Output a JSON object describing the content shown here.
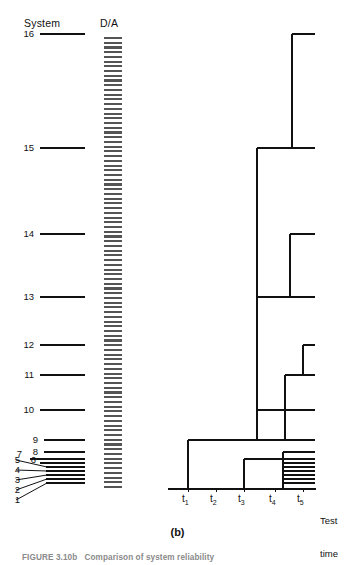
{
  "figure": {
    "panel_letter": "(b)",
    "caption": "FIGURE 3.10b   Comparison of system reliability",
    "axis_headers": {
      "system": "System",
      "da": "D/A"
    },
    "time_axis_label_line1": "Test",
    "time_axis_label_line2": "time"
  },
  "system_axis": {
    "labels": [
      "16",
      "15",
      "14",
      "13",
      "12",
      "11",
      "10",
      "9",
      "8",
      "7",
      "6",
      "5",
      "4",
      "3",
      "2",
      "1"
    ]
  },
  "time_axis": {
    "ticks": [
      "t",
      "t",
      "t",
      "t",
      "t"
    ],
    "tick_subscripts": [
      "1",
      "2",
      "3",
      "4",
      "5"
    ]
  },
  "chart_data": {
    "type": "dendrogram",
    "title": "Comparison of system reliability",
    "xlabel": "Test time",
    "ylabel": "System",
    "grid": false,
    "legend": null,
    "x_categories": [
      "t1",
      "t2",
      "t3",
      "t4",
      "t5"
    ],
    "x_tick_px": [
      188,
      216,
      244,
      275,
      303
    ],
    "y_categories": [
      "1",
      "2",
      "3",
      "4",
      "5",
      "6",
      "7",
      "8",
      "9",
      "10",
      "11",
      "12",
      "13",
      "14",
      "15",
      "16"
    ],
    "leaves": [
      {
        "system": "16",
        "y_px": 34,
        "branch_start_px": 292,
        "branch_end_px": 315
      },
      {
        "system": "15",
        "y_px": 148,
        "branch_start_px": 257,
        "branch_end_px": 315
      },
      {
        "system": "14",
        "y_px": 234,
        "branch_start_px": 290,
        "branch_end_px": 315
      },
      {
        "system": "13",
        "y_px": 297,
        "branch_start_px": 257,
        "branch_end_px": 315
      },
      {
        "system": "12",
        "y_px": 345,
        "branch_start_px": 303,
        "branch_end_px": 315
      },
      {
        "system": "11",
        "y_px": 375,
        "branch_start_px": 285,
        "branch_end_px": 315
      },
      {
        "system": "10",
        "y_px": 410,
        "branch_start_px": 257,
        "branch_end_px": 315
      },
      {
        "system": "9",
        "y_px": 440,
        "branch_start_px": 188,
        "branch_end_px": 315
      },
      {
        "system": "8",
        "y_px": 452,
        "branch_start_px": 283,
        "branch_end_px": 315
      },
      {
        "system": "7",
        "y_px": 459,
        "branch_start_px": 244,
        "branch_end_px": 315
      },
      {
        "system": "6",
        "y_px": 463,
        "branch_start_px": 283,
        "branch_end_px": 315
      },
      {
        "system": "5",
        "y_px": 467,
        "branch_start_px": 283,
        "branch_end_px": 315
      },
      {
        "system": "4",
        "y_px": 471,
        "branch_start_px": 283,
        "branch_end_px": 315
      },
      {
        "system": "3",
        "y_px": 475,
        "branch_start_px": 283,
        "branch_end_px": 315
      },
      {
        "system": "2",
        "y_px": 479,
        "branch_start_px": 283,
        "branch_end_px": 315
      },
      {
        "system": "1",
        "y_px": 483,
        "branch_start_px": 283,
        "branch_end_px": 315
      }
    ],
    "merge_links": [
      {
        "x_px": 292,
        "y_top_px": 34,
        "y_bottom_px": 148,
        "note": "16 joins 15 group"
      },
      {
        "x_px": 290,
        "y_top_px": 234,
        "y_bottom_px": 297,
        "note": "14 joins 13 group"
      },
      {
        "x_px": 303,
        "y_top_px": 345,
        "y_bottom_px": 375,
        "note": "12 joins 11"
      },
      {
        "x_px": 285,
        "y_top_px": 375,
        "y_bottom_px": 440,
        "note": "11 group joins lower trunk"
      },
      {
        "x_px": 257,
        "y_top_px": 148,
        "y_bottom_px": 297,
        "note": "15 group to 13 group"
      },
      {
        "x_px": 257,
        "y_top_px": 297,
        "y_bottom_px": 410,
        "note": "13 group to 10"
      },
      {
        "x_px": 257,
        "y_top_px": 410,
        "y_bottom_px": 440,
        "note": "10 down to trunk"
      },
      {
        "x_px": 188,
        "y_top_px": 440,
        "y_bottom_px": 488,
        "note": "t1 trunk to baseline"
      },
      {
        "x_px": 244,
        "y_top_px": 459,
        "y_bottom_px": 488,
        "note": "t3 branch to baseline"
      },
      {
        "x_px": 283,
        "y_top_px": 452,
        "y_bottom_px": 488,
        "note": "t4/t5 cluster stem"
      }
    ],
    "da_column": {
      "label": "D/A",
      "x_left_px": 104,
      "x_right_px": 122,
      "y_top_px": 38,
      "y_bottom_px": 487,
      "fill": "horizontal-hatch",
      "line_count": 96
    },
    "axis_baseline_y_px": 489,
    "axis_x_start_px": 168,
    "axis_x_end_px": 316,
    "colors": {
      "ink": "#111111",
      "hatch": "#555555",
      "background": "#ffffff"
    }
  }
}
